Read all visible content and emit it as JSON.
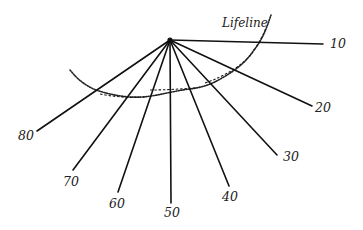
{
  "diagram": {
    "curve_label": "Lifeline",
    "hub": {
      "x": 170,
      "y": 40
    },
    "rays": [
      {
        "label": "10",
        "end": {
          "x": 323,
          "y": 44
        },
        "label_pos": {
          "x": 330,
          "y": 38
        }
      },
      {
        "label": "20",
        "end": {
          "x": 312,
          "y": 106
        },
        "label_pos": {
          "x": 315,
          "y": 102
        }
      },
      {
        "label": "30",
        "end": {
          "x": 277,
          "y": 155
        },
        "label_pos": {
          "x": 283,
          "y": 151
        }
      },
      {
        "label": "40",
        "end": {
          "x": 229,
          "y": 186
        },
        "label_pos": {
          "x": 222,
          "y": 191
        }
      },
      {
        "label": "50",
        "end": {
          "x": 171,
          "y": 203
        },
        "label_pos": {
          "x": 164,
          "y": 207
        }
      },
      {
        "label": "60",
        "end": {
          "x": 118,
          "y": 192
        },
        "label_pos": {
          "x": 109,
          "y": 198
        }
      },
      {
        "label": "70",
        "end": {
          "x": 73,
          "y": 170
        },
        "label_pos": {
          "x": 63,
          "y": 176
        }
      },
      {
        "label": "80",
        "end": {
          "x": 37,
          "y": 131
        },
        "label_pos": {
          "x": 18,
          "y": 130
        }
      }
    ],
    "colors": {
      "ink": "#111111",
      "background": "#ffffff"
    }
  }
}
